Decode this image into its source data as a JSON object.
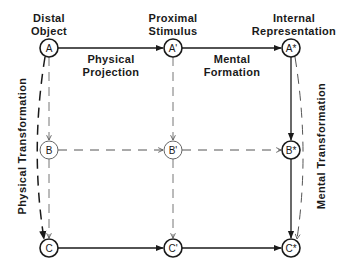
{
  "columns": [
    {
      "id": "distal",
      "header_line1": "Distal",
      "header_line2": "Object"
    },
    {
      "id": "proximal",
      "header_line1": "Proximal",
      "header_line2": "Stimulus"
    },
    {
      "id": "internal",
      "header_line1": "Internal",
      "header_line2": "Representation"
    }
  ],
  "nodes": {
    "A": "A",
    "A_prime": "A'",
    "A_star": "A*",
    "B": "B",
    "B_prime": "B'",
    "B_star": "B*",
    "C": "C",
    "C_prime": "C'",
    "C_star": "C*"
  },
  "edge_labels": {
    "physical_projection_line1": "Physical",
    "physical_projection_line2": "Projection",
    "mental_formation_line1": "Mental",
    "mental_formation_line2": "Formation",
    "physical_transformation": "Physical Transformation",
    "mental_transformation": "Mental Transformation"
  },
  "colors": {
    "ink": "#1a1a1a",
    "background": "#ffffff"
  }
}
